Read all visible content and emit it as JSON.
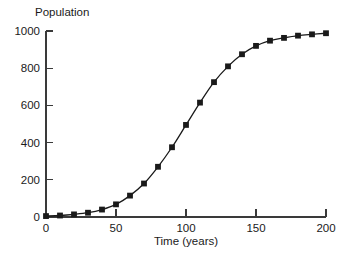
{
  "chart_data": {
    "type": "line",
    "title": "",
    "xlabel": "Time (years)",
    "ylabel": "Population",
    "xlim": [
      0,
      200
    ],
    "ylim": [
      0,
      1000
    ],
    "xticks": [
      0,
      50,
      100,
      150,
      200
    ],
    "yticks": [
      0,
      200,
      400,
      600,
      800,
      1000
    ],
    "xtick_labels": [
      "0",
      "50",
      "100",
      "150",
      "200"
    ],
    "ytick_labels": [
      "0",
      "200",
      "400",
      "600",
      "800",
      "1000"
    ],
    "grid": false,
    "legend": null,
    "marker": "square",
    "series": [
      {
        "name": "Population",
        "color": "#1a1a1a",
        "x": [
          0,
          10,
          20,
          30,
          40,
          50,
          60,
          70,
          80,
          90,
          100,
          110,
          120,
          130,
          140,
          150,
          160,
          170,
          180,
          190,
          200
        ],
        "values": [
          5,
          8,
          14,
          23,
          40,
          68,
          115,
          180,
          270,
          375,
          495,
          615,
          725,
          810,
          875,
          920,
          948,
          963,
          975,
          982,
          988
        ]
      }
    ]
  },
  "labels": {
    "y_axis_title": "Population",
    "x_axis_title": "Time (years)"
  },
  "colors": {
    "background": "#ffffff",
    "axis": "#3a3a3a",
    "data": "#1a1a1a",
    "text": "#1a1a1a"
  }
}
